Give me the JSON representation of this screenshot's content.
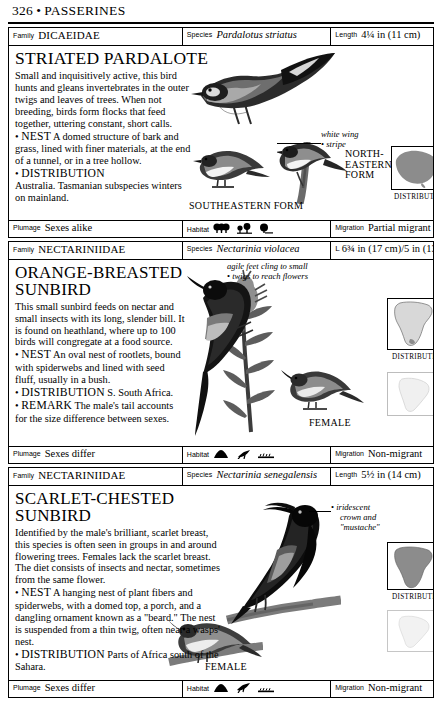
{
  "page": {
    "number": "326",
    "separator": "•",
    "section": "PASSERINES"
  },
  "labels": {
    "family": "Family",
    "species": "Species",
    "length": "Length",
    "plumage": "Plumage",
    "habitat": "Habitat",
    "migration": "Migration",
    "distribution_caption": "DISTRIBUTION"
  },
  "entries": [
    {
      "family": "DICAEIDAE",
      "species": "Pardalotus striatus",
      "length": "4¼ in (11 cm)",
      "length_icon": "",
      "title": "STRIATED PARDALOTE",
      "description": "Small and inquisitively active, this bird hunts and gleans invertebrates in the outer twigs and leaves of trees. When not breeding, birds form flocks that feed together, uttering constant, short calls.",
      "nest_label": "NEST",
      "nest": "A domed structure of bark and grass, lined with finer materials, at the end of a tunnel, or in a tree hollow.",
      "distribution_label": "DISTRIBUTION",
      "distribution": "Australia. Tasmanian subspecies winters on mainland.",
      "annotations": [
        {
          "name": "white-wing-stripe",
          "line1": "white wing",
          "line2": "stripe"
        }
      ],
      "captions": [
        {
          "name": "southeastern-form",
          "text": "SOUTHEASTERN FORM"
        },
        {
          "name": "northeastern-form",
          "text": "NORTH-EASTERN FORM"
        }
      ],
      "map_caption": "DISTRIBUTION",
      "plumage": "Sexes alike",
      "habitat_icons": [
        "forest-icon",
        "open-woodland-icon",
        "scrub-icon"
      ],
      "migration": "Partial migrant"
    },
    {
      "family": "NECTARINIIDAE",
      "species": "Nectarinia violacea",
      "length": "6¾ in (17 cm)/5 in (13 cm)",
      "length_icon": "L",
      "title_line1": "ORANGE-BREASTED",
      "title_line2": "SUNBIRD",
      "description": "This small sunbird feeds on nectar and small insects with its long, slender bill. It is found on heathland, where up to 100 birds will congregate at a food source.",
      "nest_label": "NEST",
      "nest": "An oval nest of rootlets, bound with spiderwebs and lined with seed fluff, usually in a bush.",
      "distribution_label": "DISTRIBUTION",
      "distribution": "S. South Africa.",
      "remark_label": "REMARK",
      "remark": "The male's tail accounts for the size difference between sexes.",
      "annotations": [
        {
          "name": "agile-feet",
          "line1": "agile feet cling to small",
          "line2": "twigs to reach flowers"
        }
      ],
      "captions": [
        {
          "name": "female",
          "text": "FEMALE"
        }
      ],
      "map_caption": "DISTRIBUTION",
      "plumage": "Sexes differ",
      "habitat_icons": [
        "hill-icon",
        "heath-icon",
        "scrubland-icon"
      ],
      "migration": "Non-migrant"
    },
    {
      "family": "NECTARINIIDAE",
      "species": "Nectarinia senegalensis",
      "length": "5½ in (14 cm)",
      "length_icon": "",
      "title_line1": "SCARLET-CHESTED",
      "title_line2": "SUNBIRD",
      "description": "Identified by the male's brilliant, scarlet breast, this species is often seen in groups in and around flowering trees. Females lack the scarlet breast. The diet consists of insects and nectar, sometimes from the same flower.",
      "nest_label": "NEST",
      "nest": "A hanging nest of plant fibers and spiderwebs, with a domed top, a porch, and a dangling ornament known as a \"beard.\" The nest is suspended from a thin twig, often near a wasps' nest.",
      "distribution_label": "DISTRIBUTION",
      "distribution": "Parts of Africa south of the Sahara.",
      "annotations": [
        {
          "name": "iridescent-crown",
          "line1": "iridescent",
          "line2": "crown and",
          "line3": "\"mustache\""
        }
      ],
      "captions": [
        {
          "name": "female",
          "text": "FEMALE"
        }
      ],
      "map_caption": "DISTRIBUTION",
      "plumage": "Sexes differ",
      "habitat_icons": [
        "tree-icon",
        "flying-bird-icon",
        "ground-icon"
      ],
      "migration": "Non-migrant"
    }
  ],
  "colors": {
    "ink": "#000000",
    "paper": "#ffffff",
    "map_fill": "#8c8c8c",
    "rule": "#000000"
  }
}
